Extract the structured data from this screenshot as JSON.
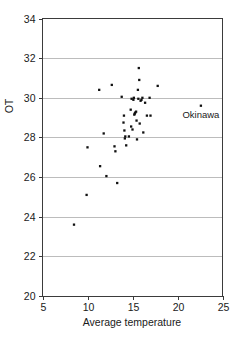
{
  "chart_data": {
    "type": "scatter",
    "title": "",
    "xlabel": "Average temperature",
    "ylabel": "OT",
    "xlim": [
      5,
      25
    ],
    "ylim": [
      20,
      34
    ],
    "xticks": [
      5,
      10,
      15,
      20,
      25
    ],
    "yticks": [
      20,
      22,
      24,
      26,
      28,
      30,
      32,
      34
    ],
    "xtick_labels": [
      "5",
      "10",
      "15",
      "20",
      "25"
    ],
    "ytick_labels": [
      "20",
      "22",
      "24",
      "26",
      "28",
      "30",
      "32",
      "34"
    ],
    "grid": "horizontal",
    "grid_values": [
      22,
      24,
      26,
      28,
      30,
      32
    ],
    "legend": "none",
    "marker": "filled-square",
    "marker_color": "#111111",
    "points": [
      {
        "x": 8.5,
        "y": 23.6
      },
      {
        "x": 9.9,
        "y": 25.1
      },
      {
        "x": 10.0,
        "y": 27.5
      },
      {
        "x": 11.3,
        "y": 30.4
      },
      {
        "x": 11.4,
        "y": 26.55
      },
      {
        "x": 11.8,
        "y": 28.2
      },
      {
        "x": 12.1,
        "y": 26.05
      },
      {
        "x": 12.7,
        "y": 30.65
      },
      {
        "x": 13.0,
        "y": 27.55
      },
      {
        "x": 13.1,
        "y": 27.3
      },
      {
        "x": 13.3,
        "y": 25.7
      },
      {
        "x": 13.8,
        "y": 30.05
      },
      {
        "x": 14.0,
        "y": 28.75
      },
      {
        "x": 14.05,
        "y": 29.1
      },
      {
        "x": 14.1,
        "y": 28.35
      },
      {
        "x": 14.15,
        "y": 27.95
      },
      {
        "x": 14.2,
        "y": 28.05
      },
      {
        "x": 14.3,
        "y": 27.6
      },
      {
        "x": 14.6,
        "y": 28.05
      },
      {
        "x": 14.8,
        "y": 29.4
      },
      {
        "x": 14.85,
        "y": 28.55
      },
      {
        "x": 14.9,
        "y": 29.95
      },
      {
        "x": 15.0,
        "y": 28.4
      },
      {
        "x": 15.1,
        "y": 29.9
      },
      {
        "x": 15.15,
        "y": 30.0
      },
      {
        "x": 15.2,
        "y": 29.15
      },
      {
        "x": 15.25,
        "y": 29.2
      },
      {
        "x": 15.3,
        "y": 29.25
      },
      {
        "x": 15.4,
        "y": 29.3
      },
      {
        "x": 15.45,
        "y": 28.85
      },
      {
        "x": 15.5,
        "y": 27.9
      },
      {
        "x": 15.6,
        "y": 30.4
      },
      {
        "x": 15.65,
        "y": 29.95
      },
      {
        "x": 15.7,
        "y": 31.5
      },
      {
        "x": 15.75,
        "y": 30.9
      },
      {
        "x": 15.8,
        "y": 28.7
      },
      {
        "x": 15.9,
        "y": 29.85
      },
      {
        "x": 16.0,
        "y": 29.9
      },
      {
        "x": 16.1,
        "y": 30.0
      },
      {
        "x": 16.2,
        "y": 28.25
      },
      {
        "x": 16.4,
        "y": 29.75
      },
      {
        "x": 16.6,
        "y": 29.1
      },
      {
        "x": 16.9,
        "y": 30.0
      },
      {
        "x": 17.0,
        "y": 29.1
      },
      {
        "x": 17.8,
        "y": 30.6
      },
      {
        "x": 22.6,
        "y": 29.6
      }
    ],
    "annotations": [
      {
        "label": "Okinawa",
        "x": 22.6,
        "y": 29.6,
        "anchor": "below"
      }
    ]
  },
  "axes": {
    "x_axis_label": "Average temperature",
    "y_axis_label": "OT"
  },
  "annotation_labels": {
    "okinawa": "Okinawa"
  }
}
